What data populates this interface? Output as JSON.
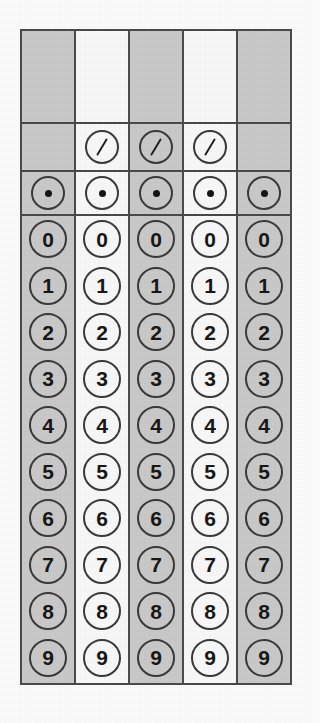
{
  "sheet": {
    "title": "Gridded-Response Answer Grid",
    "description": "Student-produced response bubble grid with five answer columns",
    "column_count": 5,
    "background_color": "#fbfbfb",
    "grid_border_color": "#4a4a4a",
    "shaded_column_color": "#c9c9c9",
    "plain_column_color": "#f8f8f8",
    "bubble_border_color": "#3a3a3a",
    "glyph_color": "#171717"
  },
  "columns": [
    {
      "index": 1,
      "shading": "shaded",
      "has_fraction_bar": false,
      "has_decimal_point": true
    },
    {
      "index": 2,
      "shading": "plain",
      "has_fraction_bar": true,
      "has_decimal_point": true
    },
    {
      "index": 3,
      "shading": "shaded",
      "has_fraction_bar": true,
      "has_decimal_point": true
    },
    {
      "index": 4,
      "shading": "plain",
      "has_fraction_bar": true,
      "has_decimal_point": true
    },
    {
      "index": 5,
      "shading": "shaded",
      "has_fraction_bar": false,
      "has_decimal_point": true
    }
  ],
  "rows": {
    "write_in": {
      "label": "",
      "type": "write-in-box"
    },
    "fraction_bar": {
      "label": "/",
      "type": "bubble",
      "icon": "fraction-slash-icon"
    },
    "decimal_point": {
      "label": "•",
      "type": "bubble",
      "icon": "decimal-point-icon"
    },
    "digits": [
      "0",
      "1",
      "2",
      "3",
      "4",
      "5",
      "6",
      "7",
      "8",
      "9"
    ]
  }
}
